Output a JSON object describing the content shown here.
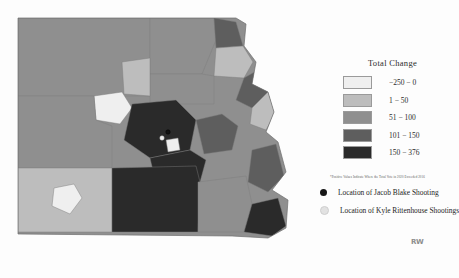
{
  "legend": {
    "title": "Total Change",
    "note": "*Positive Values Indicate Where the Total Vote in 2020 Exceeded 2016",
    "bins": [
      {
        "label": "−250 − 0",
        "color": "#efefef"
      },
      {
        "label": "1 − 50",
        "color": "#bdbdbd"
      },
      {
        "label": "51 − 100",
        "color": "#8f8f8f"
      },
      {
        "label": "101 − 150",
        "color": "#5e5e5e"
      },
      {
        "label": "150 − 376",
        "color": "#2a2a2a"
      }
    ]
  },
  "markers": [
    {
      "label": "Location of Jacob Blake Shooting",
      "style": "dark",
      "icon": "filled-circle-icon"
    },
    {
      "label": "Location of Kyle Rittenhouse Shootings",
      "style": "light",
      "icon": "hollow-circle-icon"
    }
  ],
  "watermark": {
    "text": "RW"
  },
  "chart_data": {
    "type": "heatmap",
    "title": "Total Change",
    "subtitle": "",
    "xlabel": "",
    "ylabel": "",
    "legend_position": "right",
    "grid": false,
    "categories": [
      "−250 − 0",
      "1 − 50",
      "51 − 100",
      "101 − 150",
      "150 − 376"
    ],
    "values": [
      0,
      50,
      100,
      150,
      376
    ],
    "colors": [
      "#efefef",
      "#bdbdbd",
      "#8f8f8f",
      "#5e5e5e",
      "#2a2a2a"
    ],
    "annotations": [
      "Location of Jacob Blake Shooting",
      "Location of Kyle Rittenhouse Shootings",
      "*Positive Values Indicate Where the Total Vote in 2020 Exceeded 2016"
    ],
    "regions": [
      {
        "id": "r1",
        "bin": 2,
        "d": "M18,18 L150,18 L150,96 L18,96 Z"
      },
      {
        "id": "r2",
        "bin": 2,
        "d": "M150,18 L214,18 L216,40 L202,74 L150,74 Z"
      },
      {
        "id": "r3",
        "bin": 3,
        "d": "M214,18 L236,22 L243,46 L216,48 Z"
      },
      {
        "id": "r4",
        "bin": 1,
        "d": "M216,48 L243,46 L253,62 L244,78 L214,76 Z"
      },
      {
        "id": "r5",
        "bin": 2,
        "d": "M150,74 L202,74 L214,76 L214,104 L150,104 Z"
      },
      {
        "id": "r6",
        "bin": 3,
        "d": "M244,78 L258,70 L268,92 L252,108 L236,100 Z"
      },
      {
        "id": "r7",
        "bin": 1,
        "d": "M252,108 L268,92 L276,112 L266,130 L250,124 Z"
      },
      {
        "id": "r8",
        "bin": 0,
        "d": "M94,96 L122,92 L132,108 L120,124 L96,120 Z"
      },
      {
        "id": "r9",
        "bin": 4,
        "d": "M132,104 L176,100 L196,120 L190,150 L150,158 L124,140 Z"
      },
      {
        "id": "r10",
        "bin": 4,
        "d": "M150,158 L190,150 L206,160 L200,182 L156,184 Z"
      },
      {
        "id": "r11",
        "bin": 3,
        "d": "M196,120 L222,114 L238,126 L232,150 L204,154 Z"
      },
      {
        "id": "r12",
        "bin": 2,
        "d": "M18,96 L94,96 L96,120 L112,126 L112,168 L18,168 Z"
      },
      {
        "id": "r13",
        "bin": 1,
        "d": "M18,168 L112,168 L112,232 L18,232 Z"
      },
      {
        "id": "r14",
        "bin": 0,
        "d": "M54,188 L74,184 L82,198 L70,214 L52,206 Z"
      },
      {
        "id": "r15",
        "bin": 4,
        "d": "M112,168 L196,166 L200,182 L198,232 L112,232 Z"
      },
      {
        "id": "r16",
        "bin": 2,
        "d": "M198,182 L246,176 L252,204 L244,232 L198,232 Z"
      },
      {
        "id": "r17",
        "bin": 3,
        "d": "M252,150 L276,144 L284,176 L268,192 L248,182 Z"
      },
      {
        "id": "r18",
        "bin": 4,
        "d": "M244,232 L252,204 L278,198 L286,226 L272,236 Z"
      },
      {
        "id": "r19",
        "bin": 1,
        "d": "M122,62 L150,58 L150,96 L124,94 Z"
      },
      {
        "id": "r20",
        "bin": 0,
        "d": "M166,140 L178,138 L180,150 L168,152 Z"
      }
    ],
    "points": [
      {
        "name": "Location of Jacob Blake Shooting",
        "x": 168,
        "y": 132,
        "style": "dark"
      },
      {
        "name": "Location of Kyle Rittenhouse Shootings",
        "x": 162,
        "y": 138,
        "style": "light"
      }
    ]
  }
}
